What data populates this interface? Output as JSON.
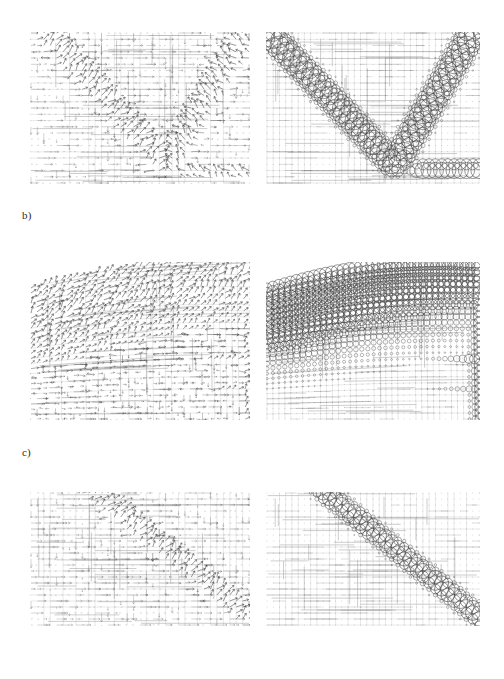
{
  "figure": {
    "background": "#ffffff",
    "ink": "#3a3a3a",
    "width": 504,
    "height": 679,
    "row_labels": [
      {
        "name": "row-label-b",
        "text": "b)",
        "x": 22,
        "y": 209
      },
      {
        "name": "row-label-c",
        "text": "c)",
        "x": 22,
        "y": 446
      }
    ]
  },
  "panels": [
    {
      "id": "a-left",
      "name": "panel-a-vector-field",
      "kind": "quiver",
      "x": 30,
      "y": 32,
      "w": 220,
      "h": 152,
      "shape": "rect",
      "grid": {
        "nx": 34,
        "ny": 24,
        "show_grid": true
      },
      "band": {
        "type": "vee",
        "x1": 0.08,
        "y1": 0.02,
        "xv": 0.62,
        "yv": 0.88,
        "x2": 0.96,
        "y2": 0.06,
        "width": 0.055
      },
      "arrow_scale": 1.0,
      "floor_band": {
        "from": 0.6,
        "to": 1.0,
        "y": 0.93
      }
    },
    {
      "id": "a-right",
      "name": "panel-a-bubble-field",
      "kind": "bubble",
      "x": 266,
      "y": 32,
      "w": 214,
      "h": 152,
      "shape": "rect",
      "grid": {
        "nx": 34,
        "ny": 24,
        "show_grid": true
      },
      "band": {
        "type": "vee",
        "x1": 0.02,
        "y1": 0.02,
        "xv": 0.6,
        "yv": 0.88,
        "x2": 0.96,
        "y2": 0.02,
        "width": 0.06
      },
      "max_radius": 9.5,
      "floor_band": {
        "from": 0.62,
        "to": 1.0,
        "y": 0.9,
        "radius": 11.0
      }
    },
    {
      "id": "b-left",
      "name": "panel-b-vector-field",
      "kind": "quiver",
      "x": 30,
      "y": 262,
      "w": 220,
      "h": 158,
      "shape": "warped",
      "grid": {
        "nx": 36,
        "ny": 26,
        "show_grid": true
      },
      "band": {
        "type": "diagonal-top",
        "x1": 0.1,
        "y1": 0.22,
        "x2": 1.0,
        "y2": -0.02,
        "width": 0.3
      },
      "arrow_scale": 0.9,
      "warp": {
        "top_left_drop": 0.16,
        "top_right_rise": 0.0,
        "right_bulge": 0.04
      }
    },
    {
      "id": "b-right",
      "name": "panel-b-bubble-field",
      "kind": "bubble",
      "x": 266,
      "y": 262,
      "w": 214,
      "h": 158,
      "shape": "warped",
      "grid": {
        "nx": 36,
        "ny": 26,
        "show_grid": true
      },
      "band": {
        "type": "diagonal-top",
        "x1": 0.1,
        "y1": 0.22,
        "x2": 1.0,
        "y2": -0.02,
        "width": 0.34
      },
      "max_radius": 8.0,
      "warp": {
        "top_left_drop": 0.16,
        "top_right_rise": 0.0,
        "right_bulge": 0.04
      }
    },
    {
      "id": "c-left",
      "name": "panel-c-vector-field",
      "kind": "quiver",
      "x": 30,
      "y": 492,
      "w": 220,
      "h": 134,
      "shape": "rect",
      "grid": {
        "nx": 34,
        "ny": 22,
        "show_grid": true
      },
      "band": {
        "type": "diagonal",
        "x1": 0.3,
        "y1": 0.0,
        "x2": 1.02,
        "y2": 0.96,
        "width": 0.05
      },
      "arrow_scale": 1.0
    },
    {
      "id": "c-right",
      "name": "panel-c-bubble-field",
      "kind": "bubble",
      "x": 266,
      "y": 492,
      "w": 214,
      "h": 134,
      "shape": "rect",
      "grid": {
        "nx": 34,
        "ny": 22,
        "show_grid": true
      },
      "band": {
        "type": "diagonal",
        "x1": 0.28,
        "y1": 0.0,
        "x2": 1.02,
        "y2": 0.96,
        "width": 0.055
      },
      "max_radius": 7.5
    }
  ],
  "chart_data": {
    "type": "scatter",
    "title": "",
    "subtitle": "",
    "xlabel": "",
    "ylabel": "",
    "legend": [],
    "grid": true,
    "panels_note": "Six sub-panels arranged as three rows of two. Left column: quiver (arrow) plots of a vector field sampled on a structured grid. Right column: bubble plots where marker radius encodes the scalar magnitude of the same field on the same grid.",
    "rows": [
      {
        "label": "a)",
        "label_visible": false,
        "left": {
          "type": "quiver",
          "feature": "V-shaped high-magnitude band descending from upper-left to lower-centre then rising to upper-right; dense horizontal arrows elsewhere; saturated arrow cluster along bottom-right floor"
        },
        "right": {
          "type": "bubble",
          "feature": "Same V band rendered as large circles; circle radius maximal along band and along bottom-right floor row; radius decays to dots away from band",
          "radius_min": 0.4,
          "radius_max": 11.0
        }
      },
      {
        "label": "b)",
        "label_visible": true,
        "left": {
          "type": "quiver",
          "feature": "Warped quadrilateral domain with curved upper boundary; broad high-magnitude diagonal region occupying the upper-right half"
        },
        "right": {
          "type": "bubble",
          "feature": "Same warped domain; circles grow toward the upper-right and along two lower-right ridges",
          "radius_min": 0.4,
          "radius_max": 9.0
        }
      },
      {
        "label": "c)",
        "label_visible": true,
        "left": {
          "type": "quiver",
          "feature": "Single diagonal high-magnitude band from top-centre to bottom-right corner; long horizontal arrows at left"
        },
        "right": {
          "type": "bubble",
          "feature": "Same diagonal band as a chain of circles growing toward the bottom-right corner",
          "radius_min": 0.4,
          "radius_max": 8.5
        }
      }
    ]
  }
}
